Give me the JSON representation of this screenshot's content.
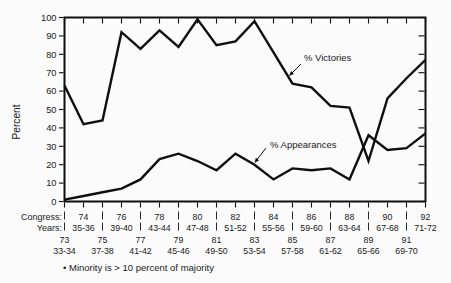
{
  "chart_data": {
    "type": "line",
    "title": "",
    "ylabel": "Percent",
    "ylim": [
      0,
      100
    ],
    "grid": false,
    "yticks": [
      "0",
      "10",
      "20",
      "30",
      "40",
      "50",
      "60",
      "70",
      "80",
      "90",
      "100"
    ],
    "x_axis": {
      "row1_label": "Congress:",
      "row2_label": "Years:",
      "congresses": [
        73,
        74,
        75,
        76,
        77,
        78,
        79,
        80,
        81,
        82,
        83,
        84,
        85,
        86,
        87,
        88,
        89,
        90,
        91,
        92
      ],
      "even_congresses": [
        "74",
        "76",
        "78",
        "80",
        "82",
        "84",
        "86",
        "88",
        "90",
        "92"
      ],
      "even_years": [
        "35-36",
        "39-40",
        "43-44",
        "47-48",
        "51-52",
        "55-56",
        "59-60",
        "63-64",
        "67-68",
        "71-72"
      ],
      "odd_congresses": [
        "73",
        "75",
        "77",
        "79",
        "81",
        "83",
        "85",
        "87",
        "89",
        "91"
      ],
      "odd_years": [
        "33-34",
        "37-38",
        "41-42",
        "45-46",
        "49-50",
        "53-54",
        "57-58",
        "61-62",
        "65-66",
        "69-70"
      ]
    },
    "series": [
      {
        "name": "% Victories",
        "values": [
          63,
          42,
          44,
          92,
          83,
          93,
          84,
          99,
          85,
          87,
          98,
          81,
          64,
          62,
          52,
          51,
          22,
          56,
          67,
          77
        ]
      },
      {
        "name": "% Appearances",
        "values": [
          1,
          3,
          5,
          7,
          12,
          23,
          26,
          22,
          17,
          26,
          20,
          12,
          18,
          17,
          18,
          12,
          36,
          28,
          29,
          37
        ]
      }
    ],
    "line_color": "#0f0f0f",
    "text_color": "#1a1a1a",
    "footnote": "• Minority is > 10 percent of majority"
  }
}
